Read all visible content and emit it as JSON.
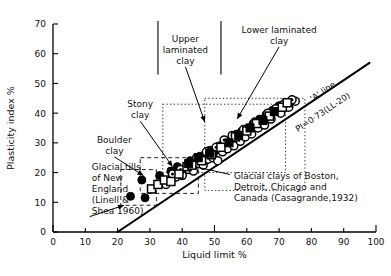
{
  "chart_data": {
    "type": "scatter",
    "title": "",
    "xlabel": "Liquid limit  %",
    "ylabel": "Plasticity index  %",
    "xlim": [
      0,
      100
    ],
    "ylim": [
      0,
      70
    ],
    "xticks": [
      0,
      10,
      20,
      30,
      40,
      50,
      60,
      70,
      80,
      90,
      100
    ],
    "yticks": [
      0,
      10,
      20,
      30,
      40,
      50,
      60,
      70
    ],
    "grid": false,
    "legend": "none",
    "reference_lines": [
      {
        "name": "A-line",
        "label_top": "'A' line",
        "label_equation": "PI=0·73(LL-20)",
        "equation_intercept_x": 20,
        "equation_slope": 0.73,
        "x_from": 20,
        "x_to": 98,
        "y_from": 0,
        "y_to": 56.9
      }
    ],
    "annotations": [
      {
        "id": "upper-laminated-clay",
        "text": "Upper\nlaminated\nclay",
        "lines": [
          "Upper",
          "laminated",
          "clay"
        ],
        "text_x": 41,
        "text_y": 64,
        "arrow_to_x": 47,
        "arrow_to_y": 37,
        "bracket": true
      },
      {
        "id": "lower-laminated-clay",
        "text": "Lower laminated\nclay",
        "lines": [
          "Lower laminated",
          "clay"
        ],
        "text_x": 70,
        "text_y": 67,
        "arrow_to_x": 57,
        "arrow_to_y": 38
      },
      {
        "id": "stony-clay",
        "text": "Stony\nclay",
        "lines": [
          "Stony",
          "clay"
        ],
        "text_x": 27,
        "text_y": 42,
        "arrow_to_x": 37,
        "arrow_to_y": 22
      },
      {
        "id": "boulder-clay",
        "text": "Boulder\nclay",
        "lines": [
          "Boulder",
          "clay"
        ],
        "text_x": 19,
        "text_y": 30,
        "arrow_to_x": 28,
        "arrow_to_y": 19
      },
      {
        "id": "glacial-tills-new-england",
        "text": "Glacial tills\nof New\nEngland\n(Linell &\nShea 1960)",
        "lines": [
          "Glacial tills",
          "of New",
          "England",
          "(Linell &",
          "Shea 1960)"
        ],
        "text_x": 12,
        "text_y": 21,
        "arrow_to_x": 22,
        "arrow_to_y": 9
      },
      {
        "id": "glacial-clays-casagrande",
        "text": "Glacial clays of Boston,\nDetroit, Chicago and\nCanada (Casagrande,1932)",
        "lines": [
          "Glacial clays of Boston,",
          "Detroit, Chicago and",
          "Canada (Casagrande,1932)"
        ],
        "text_x": 56,
        "text_y": 18,
        "arrow_to_x": 44,
        "arrow_to_y": 22
      }
    ],
    "boxes": [
      {
        "id": "boulder-clay-box",
        "style": "dashed",
        "x0": 21,
        "y0": 9,
        "x1": 32,
        "y1": 21
      },
      {
        "id": "stony-clay-box",
        "style": "dashed",
        "x0": 27,
        "y0": 13,
        "x1": 45,
        "y1": 25
      },
      {
        "id": "upper-laminated-clay-box",
        "style": "dotted",
        "x0": 34,
        "y0": 20,
        "x1": 72,
        "y1": 43
      },
      {
        "id": "lower-laminated-clay-box",
        "style": "dotted",
        "x0": 47,
        "y0": 14,
        "x1": 78,
        "y1": 45
      }
    ],
    "series": [
      {
        "name": "filled-circle",
        "marker": "filled-circle",
        "points": [
          [
            24,
            12
          ],
          [
            27.5,
            17.5
          ],
          [
            28.5,
            11.5
          ],
          [
            33,
            19
          ],
          [
            36.5,
            20.5
          ],
          [
            38.5,
            22
          ],
          [
            41,
            21.5
          ],
          [
            42.5,
            24
          ],
          [
            44,
            23.5
          ],
          [
            45.5,
            25.5
          ],
          [
            47,
            26
          ],
          [
            48.5,
            27.5
          ],
          [
            50,
            27
          ],
          [
            51.5,
            29
          ],
          [
            53.5,
            30.5
          ],
          [
            55,
            31
          ],
          [
            57,
            33
          ],
          [
            58.5,
            34
          ],
          [
            60.5,
            35
          ],
          [
            62,
            36.5
          ],
          [
            64,
            38
          ],
          [
            66,
            39.5
          ],
          [
            68,
            41
          ],
          [
            70,
            42.5
          ]
        ]
      },
      {
        "name": "open-circle",
        "marker": "open-circle",
        "points": [
          [
            35,
            16
          ],
          [
            38,
            18.5
          ],
          [
            40,
            19
          ],
          [
            42,
            21
          ],
          [
            43.5,
            20.5
          ],
          [
            45,
            23
          ],
          [
            46.5,
            22.5
          ],
          [
            48,
            24.5
          ],
          [
            49.5,
            25
          ],
          [
            51,
            24
          ],
          [
            52.5,
            27
          ],
          [
            54,
            28
          ],
          [
            56,
            29
          ],
          [
            58,
            30.5
          ],
          [
            59.5,
            32
          ],
          [
            61.5,
            33
          ],
          [
            63.5,
            35
          ],
          [
            65.5,
            36
          ],
          [
            67.5,
            38
          ],
          [
            70.5,
            40
          ],
          [
            73,
            42
          ],
          [
            75,
            44
          ]
        ]
      },
      {
        "name": "dotted-circle",
        "marker": "dotted-circle",
        "points": [
          [
            37,
            19.5
          ],
          [
            39.5,
            21
          ],
          [
            44.5,
            25
          ],
          [
            47.5,
            27
          ],
          [
            50.5,
            28.5
          ],
          [
            53,
            31
          ],
          [
            55.5,
            32.5
          ],
          [
            59,
            34.5
          ],
          [
            62.5,
            37
          ],
          [
            66.5,
            40
          ],
          [
            69,
            41.5
          ],
          [
            71.5,
            43
          ],
          [
            74,
            44.5
          ]
        ]
      },
      {
        "name": "open-square",
        "marker": "open-square",
        "points": [
          [
            30.5,
            14.5
          ],
          [
            32.5,
            16
          ],
          [
            34.5,
            17.5
          ],
          [
            36.5,
            17
          ],
          [
            39,
            19.5
          ],
          [
            41.5,
            22
          ],
          [
            43,
            22.5
          ],
          [
            46,
            24
          ],
          [
            49,
            26
          ],
          [
            52,
            28.5
          ],
          [
            56.5,
            32
          ],
          [
            60,
            34
          ],
          [
            63,
            36.5
          ],
          [
            67,
            39
          ],
          [
            71,
            42
          ],
          [
            72.5,
            43.5
          ]
        ]
      },
      {
        "name": "filled-square",
        "marker": "filled-square",
        "points": [
          [
            42,
            23
          ],
          [
            45,
            25
          ],
          [
            48.5,
            26.5
          ],
          [
            54.5,
            30
          ],
          [
            57.5,
            32.5
          ],
          [
            61,
            35
          ],
          [
            65,
            37.5
          ],
          [
            68.5,
            40.5
          ]
        ]
      }
    ]
  }
}
